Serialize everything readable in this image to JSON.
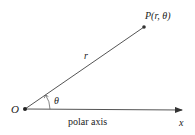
{
  "diagram": {
    "origin": {
      "label": "O",
      "x": 25,
      "y": 109
    },
    "point": {
      "label": "P(r, θ)",
      "label_p": "P",
      "label_args": "(r, θ)",
      "x": 144,
      "y": 27
    },
    "radius_label": "r",
    "angle_label": "θ",
    "axis": {
      "label": "polar axis",
      "end_label": "x",
      "end_x": 182,
      "end_y": 110
    },
    "colors": {
      "line": "#555555",
      "point": "#333333",
      "text": "#222222"
    }
  }
}
